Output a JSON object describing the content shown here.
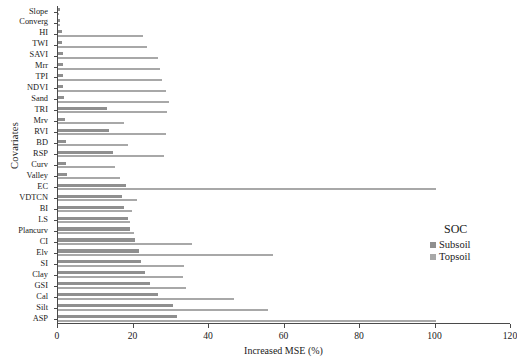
{
  "chart_data": {
    "type": "bar",
    "orientation": "horizontal",
    "title": "",
    "xlabel": "Increased MSE (%)",
    "ylabel": "Covariates",
    "xlim": [
      0,
      120
    ],
    "xticks": [
      0,
      20,
      40,
      60,
      80,
      100,
      120
    ],
    "grid": false,
    "legend": {
      "title": "SOC",
      "position": "right-middle",
      "entries": [
        {
          "name": "Subsoil",
          "color": "#8f8f8f"
        },
        {
          "name": "Topsoil",
          "color": "#a8a8a8"
        }
      ]
    },
    "categories": [
      "Slope",
      "Converg",
      "HI",
      "TWI",
      "SAVI",
      "Mrr",
      "TPI",
      "NDVI",
      "Sand",
      "TRI",
      "Mrv",
      "RVI",
      "BD",
      "RSP",
      "Curv",
      "Valley",
      "EC",
      "VDTCN",
      "BI",
      "LS",
      "Plancurv",
      "CI",
      "Elv",
      "SI",
      "Clay",
      "GSI",
      "Cal",
      "Silt",
      "ASP"
    ],
    "series": [
      {
        "name": "Subsoil",
        "color": "#8f8f8f",
        "values": [
          0.4,
          0.6,
          1.0,
          1.0,
          1.2,
          1.2,
          1.4,
          1.4,
          1.6,
          13.0,
          1.8,
          13.5,
          2.0,
          14.5,
          2.2,
          2.4,
          18.0,
          17.0,
          17.5,
          18.5,
          19.0,
          20.5,
          21.5,
          22.0,
          23.0,
          24.5,
          26.5,
          30.5,
          31.5
        ]
      },
      {
        "name": "Topsoil",
        "color": "#a8a8a8",
        "values": [
          0.3,
          0.5,
          22.5,
          23.5,
          26.5,
          27.0,
          27.5,
          28.5,
          29.5,
          29.0,
          17.5,
          28.5,
          18.5,
          28.0,
          15.0,
          16.5,
          100.0,
          21.0,
          19.5,
          19.0,
          20.0,
          35.5,
          57.0,
          33.5,
          33.0,
          34.0,
          46.5,
          55.5,
          100.0
        ]
      }
    ]
  }
}
